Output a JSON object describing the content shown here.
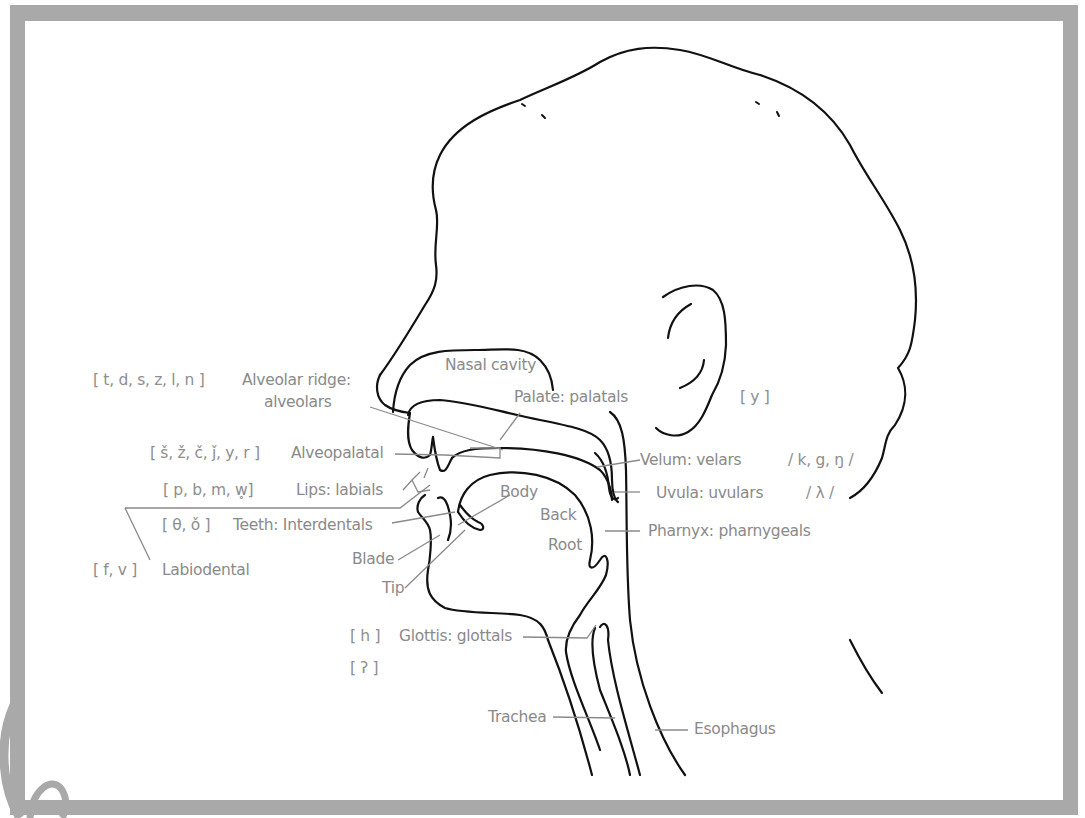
{
  "figure": {
    "frame_color": "#a9a9a9",
    "line_color": "#111111",
    "leader_color": "#8a8a8a",
    "label_color": "#8a8a8a"
  },
  "labels": {
    "nasal_cavity": "Nasal cavity",
    "alveolar_ridge_1": "Alveolar ridge:",
    "alveolar_ridge_2": "alveolars",
    "palate": "Palate: palatals",
    "alveopalatal": "Alveopalatal",
    "lips": "Lips: labials",
    "teeth": "Teeth: Interdentals",
    "labiodental": "Labiodental",
    "body": "Body",
    "back": "Back",
    "root": "Root",
    "blade": "Blade",
    "tip": "Tip",
    "velum": "Velum: velars",
    "uvula": "Uvula: uvulars",
    "pharynx": "Pharnyx: pharnygeals",
    "glottis": "Glottis: glottals",
    "trachea": "Trachea",
    "esophagus": "Esophagus"
  },
  "sounds": {
    "alveolars": "[ t, d, s, z, l, n ]",
    "alveopalatals": "[ š, ž, č, ǰ, y, r ]",
    "labials": "[ p, b, m, w̥]",
    "interdentals": "[ θ, ǒ ]",
    "labiodentals": "[ f, v ]",
    "palatals": "[ y ]",
    "velars": "/ k, g, ŋ /",
    "uvulars": "/ λ /",
    "glottal_h": "[ h ]",
    "glottal_stop": "[ ʔ ]"
  }
}
